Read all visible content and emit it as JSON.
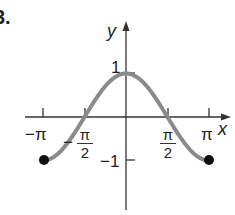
{
  "problem_number": "3.",
  "chart_data": {
    "type": "line",
    "title": "",
    "function": "y = cos(x)",
    "xlabel": "x",
    "ylabel": "y",
    "xlim": [
      -3.14159,
      3.14159
    ],
    "ylim": [
      -1,
      1
    ],
    "x_ticks": [
      "−π",
      "−π/2",
      "π/2",
      "π"
    ],
    "y_ticks": [
      "1",
      "−1"
    ],
    "endpoints": [
      {
        "x": "−π",
        "y": -1,
        "filled": true
      },
      {
        "x": "π",
        "y": -1,
        "filled": true
      }
    ],
    "series": [
      {
        "name": "cos x",
        "x": [
          -3.1416,
          -2.3562,
          -1.5708,
          -0.7854,
          0,
          0.7854,
          1.5708,
          2.3562,
          3.1416
        ],
        "values": [
          -1,
          -0.707,
          0,
          0.707,
          1,
          0.707,
          0,
          -0.707,
          -1
        ]
      }
    ],
    "grid": false,
    "legend": "none",
    "colors": {
      "curve": "#8a8a8a",
      "axes": "#333333",
      "dots": "#111111"
    }
  },
  "labels": {
    "y_axis": "y",
    "x_axis": "x",
    "y_one": "1",
    "y_neg_one": "−1",
    "neg_pi": "−π",
    "pi": "π",
    "neg_sign": "−",
    "pi_sym": "π",
    "two": "2"
  }
}
